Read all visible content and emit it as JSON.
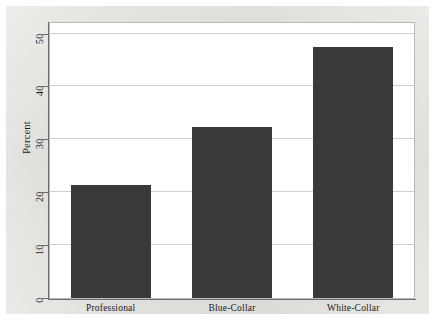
{
  "chart_data": {
    "type": "bar",
    "title": "",
    "subtitle": "",
    "xlabel": "",
    "ylabel": "Percent",
    "categories": [
      "Professional",
      "Blue-Collar",
      "White-Collar"
    ],
    "values": [
      21.4,
      32.3,
      47.4
    ],
    "series": [
      {
        "name": "Percent",
        "values": [
          21.4,
          32.3,
          47.4
        ]
      }
    ],
    "ylim": [
      0,
      52
    ],
    "yticks": [
      0,
      10,
      20,
      30,
      40,
      50
    ],
    "ytick_labels": [
      "0",
      "10",
      "20",
      "30",
      "40",
      "50"
    ],
    "xtick_labels": [
      "Professional",
      "Blue-Collar",
      "White-Collar"
    ],
    "grid": true,
    "grid_axis": "y",
    "legend": false,
    "legend_position": "none",
    "bar_color": "#3a3a3a",
    "plot_background": "#ffffff",
    "figure_background": "#d9d8d3",
    "axis_color": "#6d6d6d",
    "gridline_color": "#cfcfcf",
    "annotations": []
  }
}
